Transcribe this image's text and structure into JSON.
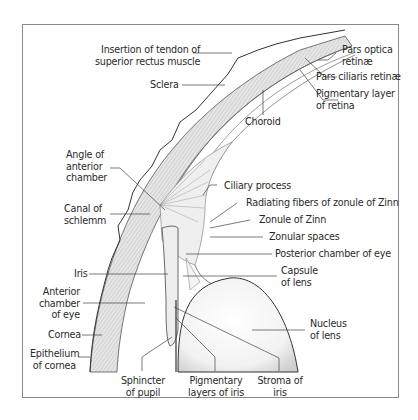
{
  "diagram": {
    "labels": {
      "insertion_tendon": [
        "Insertion of tendon of",
        "superior rectus muscle"
      ],
      "pars_optica": [
        "Pars optica",
        "retinæ"
      ],
      "pars_ciliaris": "Pars ciliaris retinæ",
      "pigmentary_layer_retina": [
        "Pigmentary layer",
        "of retina"
      ],
      "sclera": "Sclera",
      "choroid": "Choroid",
      "angle_anterior_chamber": [
        "Angle of",
        "anterior",
        "chamber"
      ],
      "ciliary_process": "Ciliary process",
      "canal_schlemm": [
        "Canal of",
        "schlemm"
      ],
      "radiating_fibers": "Radiating fibers of zonule of Zinn",
      "zonule_zinn": "Zonule of Zinn",
      "zonular_spaces": "Zonular spaces",
      "posterior_chamber": "Posterior chamber of eye",
      "iris": "Iris",
      "capsule_lens": [
        "Capsule",
        "of lens"
      ],
      "anterior_chamber": [
        "Anterior",
        "chamber",
        "of eye"
      ],
      "nucleus_lens": [
        "Nucleus",
        "of lens"
      ],
      "cornea": "Cornea",
      "epithelium_cornea": [
        "Epithelium",
        "of cornea"
      ],
      "sphincter_pupil": [
        "Sphincter",
        "of pupil"
      ],
      "pigmentary_layers_iris": [
        "Pigmentary",
        "layers of iris"
      ],
      "stroma_iris": [
        "Stroma of",
        "iris"
      ]
    }
  }
}
